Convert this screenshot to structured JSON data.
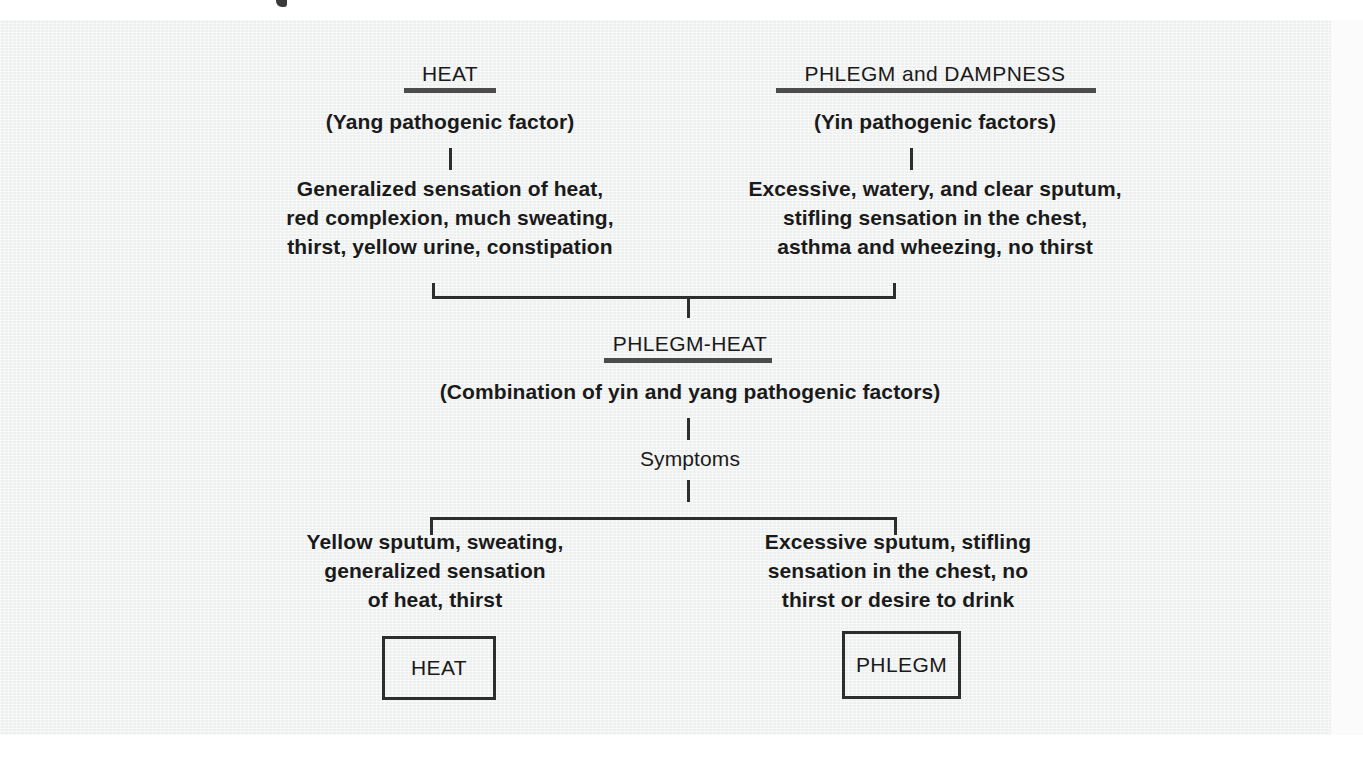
{
  "figure": {
    "background_color": "#eeefef",
    "ink_color": "#2d2d2d",
    "branches": {
      "left": {
        "title": "HEAT",
        "subtitle": "(Yang pathogenic factor)",
        "details": "Generalized sensation of heat,\nred complexion, much sweating,\nthirst, yellow urine, constipation"
      },
      "right": {
        "title": "PHLEGM and DAMPNESS",
        "subtitle": "(Yin pathogenic factors)",
        "details": "Excessive, watery, and clear sputum,\nstifling sensation in the chest,\nasthma and wheezing, no thirst"
      }
    },
    "combined": {
      "title": "PHLEGM-HEAT",
      "subtitle": "(Combination of yin and yang pathogenic factors)",
      "symptoms_label": "Symptoms"
    },
    "outcomes": {
      "left": {
        "details": "Yellow sputum, sweating,\ngeneralized sensation\nof heat, thirst",
        "box_label": "HEAT"
      },
      "right": {
        "details": "Excessive sputum, stifling\nsensation in the chest, no\nthirst or desire to drink",
        "box_label": "PHLEGM"
      }
    }
  }
}
